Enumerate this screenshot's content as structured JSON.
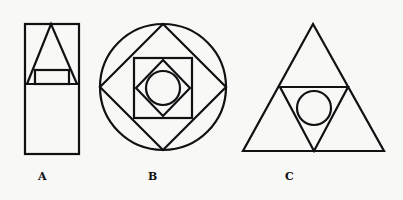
{
  "figures": [
    {
      "label": "A",
      "description": "Rectangle split horizontally; triangle in upper half with small rectangle at its base"
    },
    {
      "label": "B",
      "description": "Circle containing a diamond, a square, a smaller diamond and an inner circle"
    },
    {
      "label": "C",
      "description": "Equilateral triangle containing an inverted triangle with an inscribed circle"
    }
  ],
  "colors": {
    "stroke": "#111111",
    "background": "#f8f8f7"
  }
}
